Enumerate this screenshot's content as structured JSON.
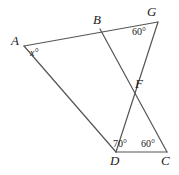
{
  "figure": {
    "type": "geometry-diagram",
    "background_color": "#ffffff",
    "stroke_color": "#555555",
    "label_color": "#1a1a1a",
    "width": 179,
    "height": 175,
    "points": [
      {
        "name": "A",
        "label": "A",
        "x": 24,
        "y": 46,
        "label_x": 11,
        "label_y": 34
      },
      {
        "name": "B",
        "label": "B",
        "x": 100,
        "y": 29,
        "label_x": 93,
        "label_y": 13
      },
      {
        "name": "G",
        "label": "G",
        "x": 158,
        "y": 22,
        "label_x": 147,
        "label_y": 5
      },
      {
        "name": "F",
        "label": "F",
        "x": 131,
        "y": 85,
        "label_x": 135,
        "label_y": 77
      },
      {
        "name": "D",
        "label": "D",
        "x": 116,
        "y": 152,
        "label_x": 110,
        "label_y": 154
      },
      {
        "name": "C",
        "label": "C",
        "x": 167,
        "y": 152,
        "label_x": 161,
        "label_y": 154
      }
    ],
    "segments": [
      {
        "name": "segment-A-G",
        "from": "A",
        "to": "G"
      },
      {
        "name": "segment-A-D",
        "from": "A",
        "to": "D"
      },
      {
        "name": "segment-B-C",
        "from": "B",
        "to": "C"
      },
      {
        "name": "segment-G-D",
        "from": "G",
        "to": "D"
      },
      {
        "name": "segment-D-C",
        "from": "D",
        "to": "C"
      }
    ],
    "angles": [
      {
        "name": "angle-at-A",
        "label": "x°",
        "vertex": "A",
        "x": 30,
        "y": 48,
        "italic": true
      },
      {
        "name": "angle-at-G",
        "label": "60°",
        "vertex": "G",
        "x": 132,
        "y": 27,
        "italic": false
      },
      {
        "name": "angle-at-D",
        "label": "70°",
        "vertex": "D",
        "x": 113,
        "y": 139,
        "italic": false
      },
      {
        "name": "angle-at-C",
        "label": "60°",
        "vertex": "C",
        "x": 141,
        "y": 139,
        "italic": false
      }
    ]
  }
}
